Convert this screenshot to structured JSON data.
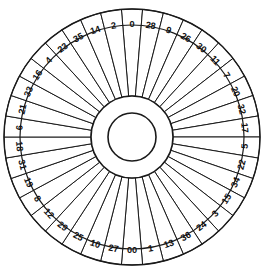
{
  "wheel": {
    "name": "american-roulette-wheel",
    "variant": "American double-zero roulette wheel",
    "pocket_count": 38,
    "orientation_note": "Pocket 0 centered at top, sequence proceeds clockwise",
    "geometry": {
      "center_x": 132,
      "center_y": 137,
      "outer_radius": 128,
      "label_ring_radius": 113,
      "sector_inner_radius": 41,
      "hub_outer_radius": 41,
      "hub_inner_radius": 24,
      "label_font_size": 9.2
    },
    "colors": {
      "stroke": "#1a1a1a",
      "fill": "#ffffff",
      "label": "#111111",
      "background": "#ffffff"
    },
    "pockets": [
      {
        "label": "0",
        "index": 0
      },
      {
        "label": "28",
        "index": 1
      },
      {
        "label": "9",
        "index": 2
      },
      {
        "label": "26",
        "index": 3
      },
      {
        "label": "30",
        "index": 4
      },
      {
        "label": "11",
        "index": 5
      },
      {
        "label": "7",
        "index": 6
      },
      {
        "label": "20",
        "index": 7
      },
      {
        "label": "32",
        "index": 8
      },
      {
        "label": "17",
        "index": 9
      },
      {
        "label": "5",
        "index": 10
      },
      {
        "label": "22",
        "index": 11
      },
      {
        "label": "34",
        "index": 12
      },
      {
        "label": "15",
        "index": 13
      },
      {
        "label": "3",
        "index": 14
      },
      {
        "label": "24",
        "index": 15
      },
      {
        "label": "36",
        "index": 16
      },
      {
        "label": "13",
        "index": 17
      },
      {
        "label": "1",
        "index": 18
      },
      {
        "label": "00",
        "index": 19
      },
      {
        "label": "27",
        "index": 20
      },
      {
        "label": "10",
        "index": 21
      },
      {
        "label": "25",
        "index": 22
      },
      {
        "label": "29",
        "index": 23
      },
      {
        "label": "12",
        "index": 24
      },
      {
        "label": "8",
        "index": 25
      },
      {
        "label": "19",
        "index": 26
      },
      {
        "label": "31",
        "index": 27
      },
      {
        "label": "18",
        "index": 28
      },
      {
        "label": "6",
        "index": 29
      },
      {
        "label": "21",
        "index": 30
      },
      {
        "label": "33",
        "index": 31
      },
      {
        "label": "16",
        "index": 32
      },
      {
        "label": "4",
        "index": 33
      },
      {
        "label": "23",
        "index": 34
      },
      {
        "label": "35",
        "index": 35
      },
      {
        "label": "14",
        "index": 36
      },
      {
        "label": "2",
        "index": 37
      }
    ]
  },
  "chart_data": {
    "type": "pie",
    "xlabel": "",
    "ylabel": "",
    "legend": "none",
    "grid": false,
    "categories": [
      "0",
      "28",
      "9",
      "26",
      "30",
      "11",
      "7",
      "20",
      "32",
      "17",
      "5",
      "22",
      "34",
      "15",
      "3",
      "24",
      "36",
      "13",
      "1",
      "00",
      "27",
      "10",
      "25",
      "29",
      "12",
      "8",
      "19",
      "31",
      "18",
      "6",
      "21",
      "33",
      "16",
      "4",
      "23",
      "35",
      "14",
      "2"
    ],
    "values": [
      1,
      1,
      1,
      1,
      1,
      1,
      1,
      1,
      1,
      1,
      1,
      1,
      1,
      1,
      1,
      1,
      1,
      1,
      1,
      1,
      1,
      1,
      1,
      1,
      1,
      1,
      1,
      1,
      1,
      1,
      1,
      1,
      1,
      1,
      1,
      1,
      1,
      1
    ],
    "slice_angle_degrees": 9.4736842,
    "start_angle_degrees": -94.7368421,
    "annotations": [
      "0 at top center",
      "00 at bottom center",
      "38 equal pockets"
    ]
  }
}
